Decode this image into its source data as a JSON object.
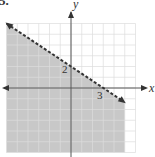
{
  "problem_number": "5.",
  "chart_data": {
    "type": "line",
    "title": "",
    "xlabel": "x",
    "ylabel": "y",
    "xlim": [
      -6,
      6
    ],
    "ylim": [
      -6,
      6
    ],
    "grid": true,
    "grid_step": 1,
    "annotations": [
      {
        "text": "2",
        "x": 0,
        "y": 2,
        "meaning": "y-intercept"
      },
      {
        "text": "3",
        "x": 3,
        "y": 0,
        "meaning": "x-intercept"
      }
    ],
    "series": [
      {
        "name": "boundary",
        "style": "dashed",
        "equation": "2x + 3y = 6",
        "points": [
          [
            -6,
            6
          ],
          [
            5,
            -1.33
          ]
        ]
      }
    ],
    "shaded_region": {
      "inequality": "2x + 3y < 6",
      "side": "below",
      "color": "#c8c8c8"
    },
    "colors": {
      "shade": "#c8c8c8",
      "grid": "#dcdcdc",
      "axis": "#555555",
      "line": "#333333"
    }
  },
  "labels": {
    "x_axis": "x",
    "y_axis": "y",
    "y_intercept": "2",
    "x_intercept": "3"
  }
}
